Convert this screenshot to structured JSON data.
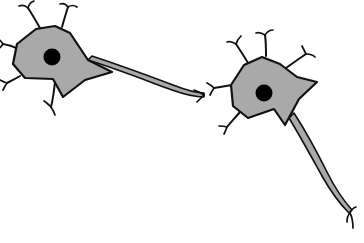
{
  "figure": {
    "type": "scientific-illustration",
    "background_color": "#ffffff",
    "width": 364,
    "height": 243
  },
  "style": {
    "soma_fill": "#a9a9a9",
    "soma_stroke": "#111111",
    "soma_stroke_width": 2.2,
    "nucleus_fill": "#000000",
    "axon_fill": "#a9a9a9",
    "axon_stroke": "#111111",
    "axon_stroke_width": 1.6,
    "dendrite_stroke": "#111111",
    "dendrite_stroke_width": 2.0,
    "terminal_stroke_width": 1.7
  },
  "neurons": [
    {
      "id": "neuron-1",
      "label": "presynaptic-neuron",
      "soma": {
        "center_x": 52,
        "center_y": 57,
        "path": "M 36 29 L 55 26 L 70 33 L 88 60 L 112 72 L 85 80 L 63 97 L 53 79 L 25 78 L 13 64 L 17 44 Z"
      },
      "nucleus": {
        "cx": 52,
        "cy": 57,
        "r": 8.5
      },
      "dendrites": [
        {
          "id": "d1-top-left",
          "path": "M 40 28 C 36 21 32 14 28 8",
          "forks": [
            "M 28 8 C 25 5 22 5 19 6",
            "M 28 8 C 29 4 31 2 34 1"
          ]
        },
        {
          "id": "d1-top-right",
          "path": "M 62 27 C 64 20 66 13 68 7",
          "forks": [
            "M 68 7 C 66 4 63 3 60 4",
            "M 68 7 C 71 5 74 5 77 7"
          ]
        },
        {
          "id": "d1-left-up",
          "path": "M 16 48 C 12 46 8 45 3 44",
          "forks": [
            "M 3 44 C 1 41 0 40 -2 39",
            "M 3 44 C 1 47 0 48 -2 49"
          ]
        },
        {
          "id": "d1-left-low",
          "path": "M 20 76 C 15 79 11 81 7 83",
          "forks": [
            "M 7 83 C 4 82 2 81 0 80",
            "M 7 83 C 5 86 4 88 3 90"
          ]
        },
        {
          "id": "d1-bottom",
          "path": "M 55 82 C 54 91 53 99 51 107",
          "forks": [
            "M 51 107 C 48 104 46 102 44 101",
            "M 51 107 C 53 110 54 112 55 115"
          ]
        }
      ],
      "axon": {
        "id": "axon-1",
        "direction": "right",
        "path": "M 88 60 C 120 70 150 82 172 90 C 186 95 196 97 204 97 L 204 93 C 196 93 186 90 173 85 C 152 77 122 66 92 56 Z",
        "terminal_x": 204,
        "terminal_y": 95,
        "terminals": [
          {
            "id": "t1a",
            "path": "M 204 95 C 200 92 197 91 194 90"
          },
          {
            "id": "t1b",
            "path": "M 204 95 C 201 98 199 100 197 102"
          }
        ]
      }
    },
    {
      "id": "neuron-2",
      "label": "postsynaptic-neuron",
      "soma": {
        "center_x": 264,
        "center_y": 93,
        "path": "M 244 65 L 262 57 L 280 64 L 297 77 L 317 82 L 299 99 L 285 125 L 274 109 L 248 118 L 233 106 L 231 85 Z"
      },
      "nucleus": {
        "cx": 264,
        "cy": 93,
        "r": 8.5
      },
      "dendrites": [
        {
          "id": "d2-top-left",
          "path": "M 248 63 C 244 56 240 50 236 44",
          "forks": [
            "M 236 44 C 233 42 230 41 227 42",
            "M 236 44 C 237 40 239 38 241 36"
          ]
        },
        {
          "id": "d2-top",
          "path": "M 266 56 C 266 48 266 42 265 35",
          "forks": [
            "M 265 35 C 262 33 259 32 256 33",
            "M 265 35 C 267 32 270 30 273 30"
          ]
        },
        {
          "id": "d2-top-right",
          "path": "M 286 68 C 293 63 300 58 306 54",
          "forks": [
            "M 306 54 C 304 50 303 48 302 46",
            "M 306 54 C 310 54 313 55 315 57"
          ]
        },
        {
          "id": "d2-left",
          "path": "M 232 85 C 226 86 220 87 214 88",
          "forks": [
            "M 214 88 C 211 85 209 84 207 83",
            "M 214 88 C 212 91 211 93 210 95"
          ]
        },
        {
          "id": "d2-bottom-left",
          "path": "M 240 112 C 235 118 231 122 227 127",
          "forks": [
            "M 227 127 C 224 126 222 126 219 126",
            "M 227 127 C 226 130 225 132 224 134"
          ]
        }
      ],
      "axon": {
        "id": "axon-2",
        "direction": "down-right",
        "path": "M 289 118 C 300 136 312 158 322 176 C 331 192 340 204 349 213 L 352 210 C 343 200 335 188 327 172 C 317 152 305 130 294 113 Z",
        "terminal_x": 350,
        "terminal_y": 213,
        "terminals": [
          {
            "id": "t2a",
            "path": "M 350 213 C 351 210 353 208 356 207"
          },
          {
            "id": "t2b",
            "path": "M 350 213 C 348 215 347 218 347 222"
          },
          {
            "id": "t2c",
            "path": "M 350 213 C 352 217 353 222 353 228"
          }
        ]
      }
    }
  ]
}
